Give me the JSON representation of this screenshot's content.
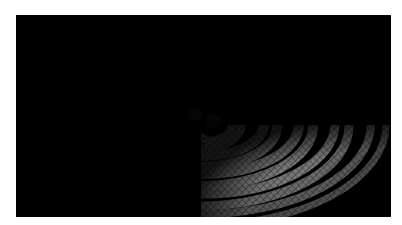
{
  "image": {
    "subject": "Binary black hole merger producing spiral gravitational waves on a spacetime grid",
    "colors": {
      "background": "#000000",
      "wave_crest": "#c8c8c8",
      "wave_trough": "#1a1a1a",
      "grid": "#9a9a9a",
      "black_hole": "#050505"
    },
    "objects": [
      {
        "name": "black-hole-1",
        "cx": 190,
        "cy": 110
      },
      {
        "name": "black-hole-2",
        "cx": 212,
        "cy": 120
      }
    ]
  }
}
